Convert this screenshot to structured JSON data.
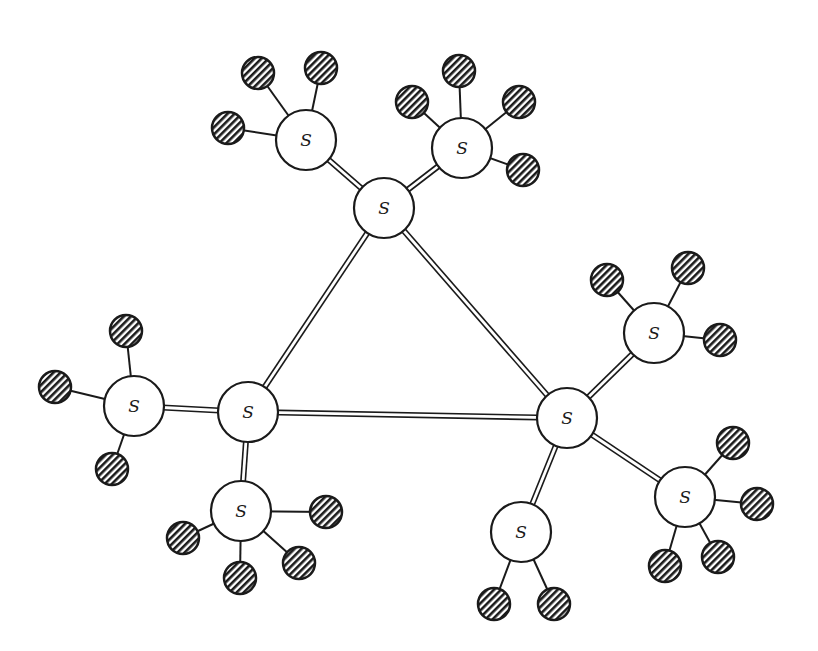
{
  "diagram": {
    "type": "molecular-structure",
    "colors": {
      "stroke": "#1a1a1a",
      "node_fill": "#ffffff",
      "background": "#ffffff"
    },
    "sulfur_radius": 30,
    "h_radius": 16,
    "nodes": [
      {
        "id": "S1",
        "label": "S",
        "x": 384,
        "y": 208
      },
      {
        "id": "S2",
        "label": "S",
        "x": 248,
        "y": 412
      },
      {
        "id": "S3",
        "label": "S",
        "x": 567,
        "y": 418
      },
      {
        "id": "S4",
        "label": "S",
        "x": 306,
        "y": 140
      },
      {
        "id": "S5",
        "label": "S",
        "x": 462,
        "y": 148
      },
      {
        "id": "S6",
        "label": "S",
        "x": 134,
        "y": 406
      },
      {
        "id": "S7",
        "label": "S",
        "x": 241,
        "y": 511
      },
      {
        "id": "S8",
        "label": "S",
        "x": 654,
        "y": 333
      },
      {
        "id": "S9",
        "label": "S",
        "x": 685,
        "y": 497
      },
      {
        "id": "S10",
        "label": "S",
        "x": 521,
        "y": 532
      }
    ],
    "double_bonds": [
      [
        "S1",
        "S2"
      ],
      [
        "S1",
        "S3"
      ],
      [
        "S2",
        "S3"
      ],
      [
        "S1",
        "S4"
      ],
      [
        "S1",
        "S5"
      ],
      [
        "S2",
        "S6"
      ],
      [
        "S2",
        "S7"
      ],
      [
        "S3",
        "S8"
      ],
      [
        "S3",
        "S9"
      ],
      [
        "S3",
        "S10"
      ]
    ],
    "hatched_atoms": [
      {
        "parent": "S4",
        "x": 258,
        "y": 73
      },
      {
        "parent": "S4",
        "x": 321,
        "y": 68
      },
      {
        "parent": "S4",
        "x": 228,
        "y": 128
      },
      {
        "parent": "S5",
        "x": 459,
        "y": 71
      },
      {
        "parent": "S5",
        "x": 412,
        "y": 102
      },
      {
        "parent": "S5",
        "x": 519,
        "y": 102
      },
      {
        "parent": "S5",
        "x": 523,
        "y": 170
      },
      {
        "parent": "S6",
        "x": 126,
        "y": 331
      },
      {
        "parent": "S6",
        "x": 55,
        "y": 387
      },
      {
        "parent": "S6",
        "x": 112,
        "y": 469
      },
      {
        "parent": "S7",
        "x": 326,
        "y": 512
      },
      {
        "parent": "S7",
        "x": 183,
        "y": 538
      },
      {
        "parent": "S7",
        "x": 299,
        "y": 563
      },
      {
        "parent": "S7",
        "x": 240,
        "y": 578
      },
      {
        "parent": "S8",
        "x": 607,
        "y": 280
      },
      {
        "parent": "S8",
        "x": 688,
        "y": 268
      },
      {
        "parent": "S8",
        "x": 720,
        "y": 340
      },
      {
        "parent": "S9",
        "x": 733,
        "y": 443
      },
      {
        "parent": "S9",
        "x": 757,
        "y": 504
      },
      {
        "parent": "S9",
        "x": 665,
        "y": 566
      },
      {
        "parent": "S9",
        "x": 718,
        "y": 557
      },
      {
        "parent": "S10",
        "x": 494,
        "y": 604
      },
      {
        "parent": "S10",
        "x": 554,
        "y": 604
      }
    ]
  }
}
